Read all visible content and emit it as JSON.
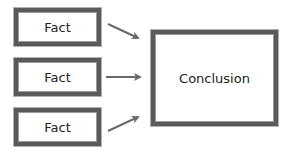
{
  "diagram": {
    "type": "flow",
    "facts": [
      {
        "label": "Fact"
      },
      {
        "label": "Fact"
      },
      {
        "label": "Fact"
      }
    ],
    "conclusion": {
      "label": "Conclusion"
    },
    "edges": [
      {
        "from": "fact-1",
        "to": "conclusion"
      },
      {
        "from": "fact-2",
        "to": "conclusion"
      },
      {
        "from": "fact-3",
        "to": "conclusion"
      }
    ],
    "colors": {
      "border": "#5a5a5a",
      "arrow": "#6a6a6a",
      "text": "#222222",
      "background": "#ffffff"
    }
  }
}
